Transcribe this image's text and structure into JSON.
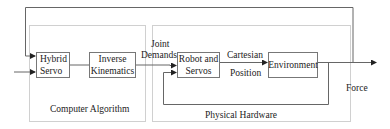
{
  "diagram": {
    "groups": [
      {
        "id": "computer-algorithm",
        "label": "Computer Algorithm"
      },
      {
        "id": "physical-hardware",
        "label": "Physical Hardware"
      }
    ],
    "blocks": [
      {
        "id": "hybrid-servo",
        "line1": "Hybrid",
        "line2": "Servo"
      },
      {
        "id": "inverse-kinematics",
        "line1": "Inverse",
        "line2": "Kinematics"
      },
      {
        "id": "robot-and-servos",
        "line1": "Robot and",
        "line2": "Servos"
      },
      {
        "id": "environment",
        "line1": "Environment"
      }
    ],
    "edge_labels": {
      "joint_demands_1": "Joint",
      "joint_demands_2": "Demands",
      "cartesian_position_1": "Cartesian",
      "cartesian_position_2": "Position",
      "force": "Force"
    },
    "colors": {
      "line": "#555555",
      "group_border": "#cccccc",
      "block_border": "#777777"
    }
  }
}
